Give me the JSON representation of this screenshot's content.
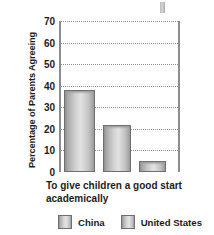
{
  "chart_data": {
    "type": "bar",
    "title": "",
    "xlabel": "To give children a good start academically",
    "ylabel": "Percentage of Parents Agreeing",
    "categories": [
      "To give children a good start academically"
    ],
    "ylim": [
      0,
      70
    ],
    "yticks": [
      0,
      10,
      20,
      30,
      40,
      50,
      60,
      70
    ],
    "ytick_labels": [
      "0",
      "10",
      "20",
      "30",
      "40",
      "50",
      "60",
      "70"
    ],
    "grid": true,
    "legend_position": "bottom",
    "bars": [
      {
        "label": "China",
        "value": 38
      },
      {
        "label": "United States",
        "value": 22
      },
      {
        "label": "",
        "value": 5
      }
    ],
    "series": [
      {
        "name": "China",
        "values": [
          38
        ]
      },
      {
        "name": "United States",
        "values": [
          22
        ]
      }
    ],
    "legend": [
      "China",
      "United States"
    ],
    "colors": {
      "bar_fill_light": "#e2e2e2",
      "bar_fill_dark": "#8e8e8e",
      "bar_border": "#6f6f6f",
      "axis": "#8d8d8d",
      "gridline": "#8f8f8f",
      "text": "#1c1c1c",
      "background": "#ffffff"
    }
  },
  "legend": {
    "items": [
      {
        "label": "China"
      },
      {
        "label": "United States"
      }
    ]
  }
}
